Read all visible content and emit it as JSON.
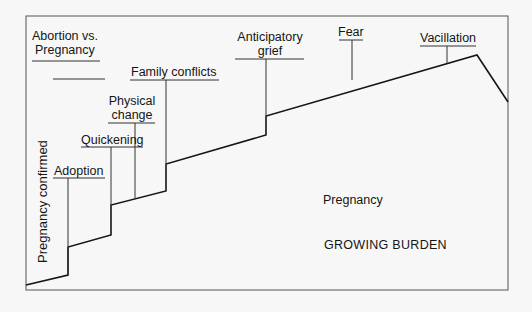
{
  "diagram": {
    "type": "stepped-line",
    "title": "",
    "axis_labels": {
      "vertical_left": "Pregnancy confirmed"
    },
    "annotations": [
      {
        "id": "abortion",
        "lines": [
          "Abortion vs.",
          "Pregnancy"
        ]
      },
      {
        "id": "adoption",
        "lines": [
          "Adoption"
        ]
      },
      {
        "id": "quickening",
        "lines": [
          "Quickening"
        ]
      },
      {
        "id": "physical",
        "lines": [
          "Physical",
          "change"
        ]
      },
      {
        "id": "family",
        "lines": [
          "Family conflicts"
        ]
      },
      {
        "id": "grief",
        "lines": [
          "Anticipatory",
          "grief"
        ]
      },
      {
        "id": "fear",
        "lines": [
          "Fear"
        ]
      },
      {
        "id": "vacillation",
        "lines": [
          "Vacillation"
        ]
      }
    ],
    "inner_labels": {
      "pregnancy": "Pregnancy",
      "burden": "GROWING BURDEN"
    },
    "colors": {
      "line": "#151515",
      "frame": "#555555",
      "background": "#f7f7f7"
    }
  }
}
